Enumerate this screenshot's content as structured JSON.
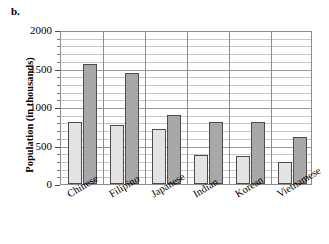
{
  "panel": {
    "letter": "b."
  },
  "chart_data": {
    "type": "bar",
    "title": "",
    "xlabel": "",
    "ylabel": "Population (in thousands)",
    "ylim": [
      0,
      2000
    ],
    "ytick_values": [
      0,
      500,
      1000,
      1500,
      2000
    ],
    "ytick_labels": [
      "0",
      "500",
      "1000",
      "1500",
      "2000"
    ],
    "minor_tick_step": 100,
    "grid": true,
    "legend": "none",
    "categories": [
      "Chinese",
      "Filipino",
      "Japanese",
      "Indian",
      "Korean",
      "Vietnamese"
    ],
    "series": [
      {
        "name": "Series 1",
        "color": "#e3e3e3",
        "values": [
          805,
          765,
          715,
          380,
          365,
          285
        ]
      },
      {
        "name": "Series 2",
        "color": "#a8a8a8",
        "values": [
          1555,
          1440,
          895,
          805,
          800,
          610
        ]
      }
    ]
  }
}
